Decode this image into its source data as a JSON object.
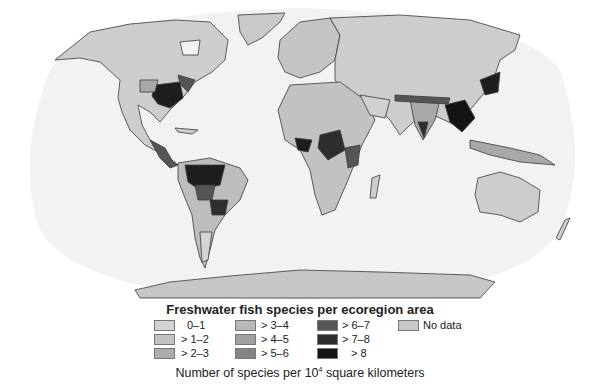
{
  "title": "Freshwater fish species per ecoregion area",
  "units_prefix": "Number of species per 10",
  "units_exp": "4",
  "units_suffix": " square kilometers",
  "legend": [
    {
      "label": "0–1",
      "color": "#d4d4d4"
    },
    {
      "label": "> 1–2",
      "color": "#c2c2c2"
    },
    {
      "label": "> 2–3",
      "color": "#adadad"
    },
    {
      "label": "> 3–4",
      "color": "#b8b8b8"
    },
    {
      "label": "> 4–5",
      "color": "#a0a0a0"
    },
    {
      "label": "> 5–6",
      "color": "#858585"
    },
    {
      "label": "> 6–7",
      "color": "#555555"
    },
    {
      "label": "> 7–8",
      "color": "#2e2e2e"
    },
    {
      "label": "> 8",
      "color": "#141414"
    }
  ],
  "no_data": {
    "label": "No data",
    "color": "#c8c8c8"
  },
  "colors": {
    "ocean": "#f2f2f2",
    "border": "#3a3a3a",
    "land_base": "#cfcfcf"
  }
}
